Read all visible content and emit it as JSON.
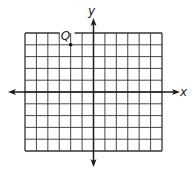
{
  "figure": {
    "type": "coordinate-plane",
    "background": "#ffffff",
    "line_color": "#333333",
    "axis_color": "#1a1a1a",
    "grid": {
      "columns": 12,
      "rows": 10,
      "x_range": [
        -6,
        6
      ],
      "y_range": [
        -5,
        5
      ]
    },
    "axes": {
      "x_label": "x",
      "y_label": "y"
    },
    "points": [
      {
        "label": "Q",
        "x": -2,
        "y": 4
      }
    ]
  },
  "chart_data": {
    "type": "scatter",
    "title": "",
    "xlabel": "x",
    "ylabel": "y",
    "xlim": [
      -6,
      6
    ],
    "ylim": [
      -5,
      5
    ],
    "grid": true,
    "points": [
      {
        "label": "Q",
        "x": -2,
        "y": 4
      }
    ]
  }
}
